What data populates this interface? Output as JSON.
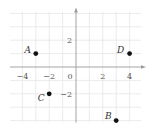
{
  "diagram": {
    "type": "coordinate-plane",
    "grid": {
      "x_min": -5,
      "x_max": 5,
      "y_min": -4,
      "y_max": 4,
      "step": 1
    },
    "origin_px": {
      "x": 76,
      "y": 67
    },
    "unit_px": 13.4,
    "colors": {
      "grid": "#e6e6e6",
      "axis": "#9a9a9a",
      "point": "#111111",
      "text": "#444444"
    },
    "x_ticks": [
      {
        "value": -4,
        "label": "−4"
      },
      {
        "value": -2,
        "label": "−2"
      },
      {
        "value": 2,
        "label": "2"
      },
      {
        "value": 4,
        "label": "4"
      }
    ],
    "origin_label": "0",
    "y_ticks": [
      {
        "value": 2,
        "label": "2"
      },
      {
        "value": -2,
        "label": "−2"
      }
    ],
    "points": [
      {
        "name": "A",
        "x": -3,
        "y": 1
      },
      {
        "name": "B",
        "x": 3,
        "y": -4
      },
      {
        "name": "C",
        "x": -2,
        "y": -2
      },
      {
        "name": "D",
        "x": 4,
        "y": 1
      }
    ]
  }
}
